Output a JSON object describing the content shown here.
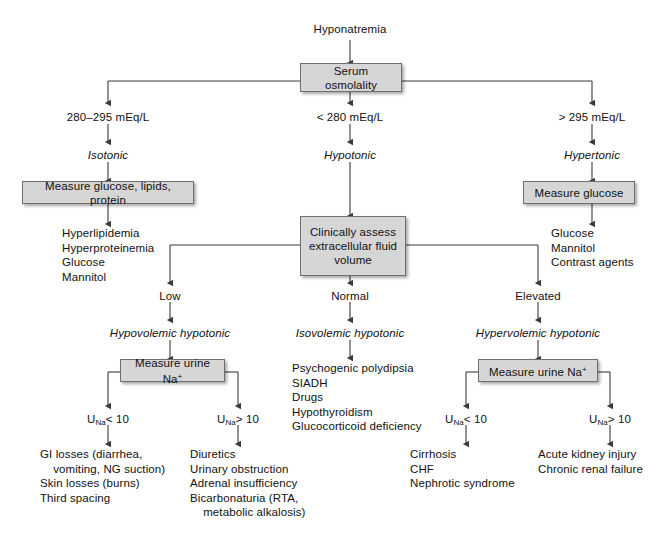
{
  "diagram": {
    "root_label": "Hyponatremia",
    "nodes": {
      "serum_osmolality": "Serum osmolality",
      "measure_glucose_lipids_protein": "Measure glucose, lipids, protein",
      "measure_glucose": "Measure glucose",
      "clinically_assess": "Clinically assess\nextracellular fluid\nvolume",
      "measure_urine_na_left": "Measure urine Na",
      "measure_urine_na_right": "Measure urine Na"
    },
    "branch_labels": {
      "osm_isotonic_value": "280–295 mEq/L",
      "osm_hypotonic_value": "< 280 mEq/L",
      "osm_hypertonic_value": "> 295 mEq/L",
      "isotonic": "Isotonic",
      "hypotonic": "Hypotonic",
      "hypertonic": "Hypertonic",
      "volume_low": "Low",
      "volume_normal": "Normal",
      "volume_elevated": "Elevated",
      "hypovolemic_hypotonic": "Hypovolemic hypotonic",
      "isovolemic_hypotonic": "Isovolemic hypotonic",
      "hypervolemic_hypotonic": "Hypervolemic hypotonic",
      "una_lt10_left": "< 10",
      "una_gt10_left": "> 10",
      "una_lt10_right": "< 10",
      "una_gt10_right": "> 10",
      "una_prefix": "U",
      "una_subscript": "Na",
      "na_superscript": "+"
    },
    "outcomes": {
      "isotonic_causes": "Hyperlipidemia\nHyperproteinemia\nGlucose\nMannitol",
      "hypertonic_causes": "Glucose\nMannitol\nContrast agents",
      "isovolemic_causes": "Psychogenic polydipsia\nSIADH\nDrugs\nHypothyroidism\nGlucocorticoid deficiency",
      "hypovolemic_low_una": "GI losses (diarrhea,\n    vomiting, NG suction)\nSkin losses (burns)\nThird spacing",
      "hypovolemic_high_una": "Diuretics\nUrinary obstruction\nAdrenal insufficiency\nBicarbonaturia (RTA,\n    metabolic alkalosis)",
      "hypervolemic_low_una": "Cirrhosis\nCHF\nNephrotic syndrome",
      "hypervolemic_high_una": "Acute kidney injury\nChronic renal failure"
    },
    "colors": {
      "box_fill": "#d6d6d6",
      "box_border": "#6f6f6f",
      "line": "#3a3a3a",
      "text": "#111111",
      "background": "#ffffff"
    }
  }
}
